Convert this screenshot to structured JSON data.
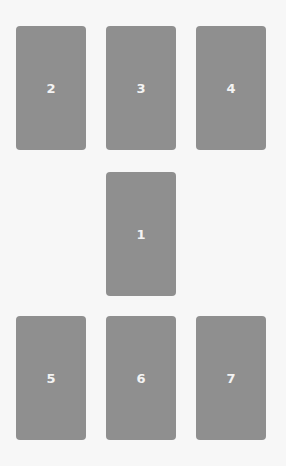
{
  "spread": {
    "background": "#f7f7f7",
    "card_color": "#8f8f8f",
    "cards": [
      {
        "position": "2",
        "label": "2"
      },
      {
        "position": "3",
        "label": "3"
      },
      {
        "position": "4",
        "label": "4"
      },
      {
        "position": "1",
        "label": "1"
      },
      {
        "position": "5",
        "label": "5"
      },
      {
        "position": "6",
        "label": "6"
      },
      {
        "position": "7",
        "label": "7"
      }
    ]
  }
}
